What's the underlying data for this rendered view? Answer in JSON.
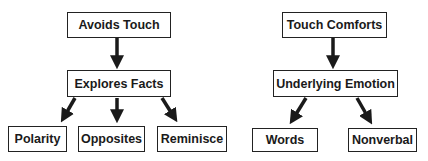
{
  "diagram": {
    "left_tree": {
      "root": "Avoids Touch",
      "middle": "Explores Facts",
      "leaves": [
        "Polarity",
        "Opposites",
        "Reminisce"
      ]
    },
    "right_tree": {
      "root": "Touch Comforts",
      "middle": "Underlying Emotion",
      "leaves": [
        "Words",
        "Nonverbal"
      ]
    }
  },
  "colors": {
    "box_border": "#222222",
    "arrow": "#1a1a1a",
    "text": "#1a1a1a",
    "background": "#ffffff"
  }
}
